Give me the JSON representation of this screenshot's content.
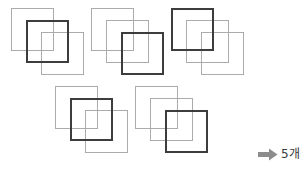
{
  "figure": {
    "background_color": "#ffffff",
    "light_square_color": "#ababab",
    "dark_square_color": "#3d3d3d",
    "arrow_color": "#8c8c8c",
    "group_count": 5,
    "squares_per_group": 3
  },
  "groups": [
    {
      "name": "group-1",
      "left": 8,
      "top": 6,
      "highlight_index": 1,
      "squares": [
        {
          "name": "square-back",
          "x": 3,
          "y": 2,
          "size": 43,
          "weight": "light"
        },
        {
          "name": "square-middle",
          "x": 18,
          "y": 14,
          "size": 43,
          "weight": "dark"
        },
        {
          "name": "square-front",
          "x": 33,
          "y": 26,
          "size": 43,
          "weight": "light"
        }
      ]
    },
    {
      "name": "group-2",
      "left": 88,
      "top": 6,
      "highlight_index": 2,
      "squares": [
        {
          "name": "square-back",
          "x": 3,
          "y": 2,
          "size": 43,
          "weight": "light"
        },
        {
          "name": "square-middle",
          "x": 18,
          "y": 14,
          "size": 43,
          "weight": "light"
        },
        {
          "name": "square-front",
          "x": 33,
          "y": 26,
          "size": 43,
          "weight": "dark"
        }
      ]
    },
    {
      "name": "group-3",
      "left": 168,
      "top": 6,
      "highlight_index": 0,
      "squares": [
        {
          "name": "square-back",
          "x": 3,
          "y": 2,
          "size": 43,
          "weight": "dark"
        },
        {
          "name": "square-middle",
          "x": 18,
          "y": 14,
          "size": 43,
          "weight": "light"
        },
        {
          "name": "square-front",
          "x": 33,
          "y": 26,
          "size": 43,
          "weight": "light"
        }
      ]
    },
    {
      "name": "group-4",
      "left": 52,
      "top": 84,
      "highlight_index": 1,
      "squares": [
        {
          "name": "square-back",
          "x": 3,
          "y": 2,
          "size": 43,
          "weight": "light"
        },
        {
          "name": "square-middle",
          "x": 18,
          "y": 14,
          "size": 43,
          "weight": "dark"
        },
        {
          "name": "square-front",
          "x": 33,
          "y": 26,
          "size": 43,
          "weight": "light"
        }
      ]
    },
    {
      "name": "group-5",
      "left": 132,
      "top": 84,
      "highlight_index": 2,
      "squares": [
        {
          "name": "square-back",
          "x": 3,
          "y": 2,
          "size": 43,
          "weight": "light"
        },
        {
          "name": "square-middle",
          "x": 18,
          "y": 14,
          "size": 43,
          "weight": "light"
        },
        {
          "name": "square-front",
          "x": 33,
          "y": 26,
          "size": 43,
          "weight": "dark"
        }
      ]
    }
  ],
  "answer": {
    "name": "answer-callout",
    "left": 258,
    "top": 148,
    "arrow_icon": "arrow-right-icon",
    "text": "5개"
  }
}
